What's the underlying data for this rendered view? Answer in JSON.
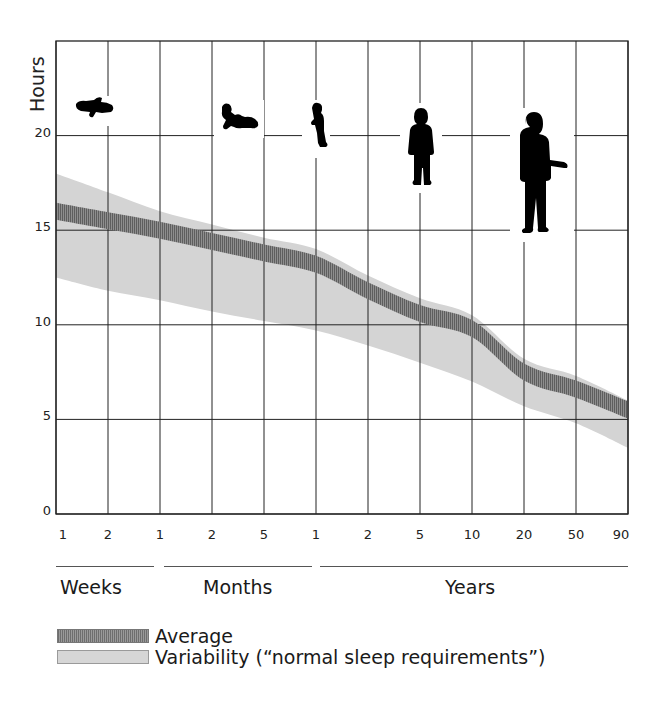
{
  "chart_data": {
    "type": "area",
    "title": "",
    "ylabel": "Hours",
    "xlabel": "",
    "ylim": [
      0,
      25
    ],
    "grid": true,
    "yticks": [
      0,
      5,
      10,
      15,
      20
    ],
    "categories": [
      "1",
      "2",
      "1",
      "2",
      "5",
      "1",
      "2",
      "5",
      "10",
      "20",
      "50",
      "90"
    ],
    "category_groups": [
      {
        "label": "Weeks",
        "ticks": [
          "1",
          "2"
        ]
      },
      {
        "label": "Months",
        "ticks": [
          "1",
          "2",
          "5"
        ]
      },
      {
        "label": "Years",
        "ticks": [
          "1",
          "2",
          "5",
          "10",
          "20",
          "50",
          "90"
        ]
      }
    ],
    "series": [
      {
        "name": "Average",
        "values": [
          16.0,
          15.5,
          15.0,
          14.4,
          13.8,
          13.2,
          11.8,
          10.6,
          9.8,
          7.5,
          6.6,
          5.5
        ]
      },
      {
        "name": "Variability upper",
        "values": [
          18.0,
          17.0,
          16.0,
          15.3,
          14.6,
          14.0,
          12.6,
          11.4,
          10.5,
          8.2,
          7.3,
          6.0
        ]
      },
      {
        "name": "Variability lower",
        "values": [
          12.5,
          11.8,
          11.3,
          10.7,
          10.2,
          9.7,
          8.9,
          8.0,
          7.0,
          5.7,
          4.8,
          3.5
        ]
      }
    ],
    "legend": [
      {
        "name": "Average",
        "style": "dark hatched band"
      },
      {
        "name": "Variability (“normal sleep requirements”)",
        "style": "light gray band"
      }
    ],
    "legend_position": "bottom-left",
    "annotations": [
      "newborn-silhouette",
      "crawling-baby-silhouette",
      "toddler-silhouette",
      "child-silhouette",
      "adult-silhouette"
    ]
  },
  "axis": {
    "y_title": "Hours",
    "y_ticks": [
      "0",
      "5",
      "10",
      "15",
      "20"
    ],
    "x_ticks": [
      "1",
      "2",
      "1",
      "2",
      "5",
      "1",
      "2",
      "5",
      "10",
      "20",
      "50",
      "90"
    ]
  },
  "groups": {
    "weeks": "Weeks",
    "months": "Months",
    "years": "Years"
  },
  "legend": {
    "average": "Average",
    "variability": "Variability (“normal sleep requirements”)"
  },
  "colors": {
    "average_band": "#7a7a7a",
    "variability_band": "#d4d4d4",
    "grid": "#222222",
    "silhouette": "#000000"
  }
}
